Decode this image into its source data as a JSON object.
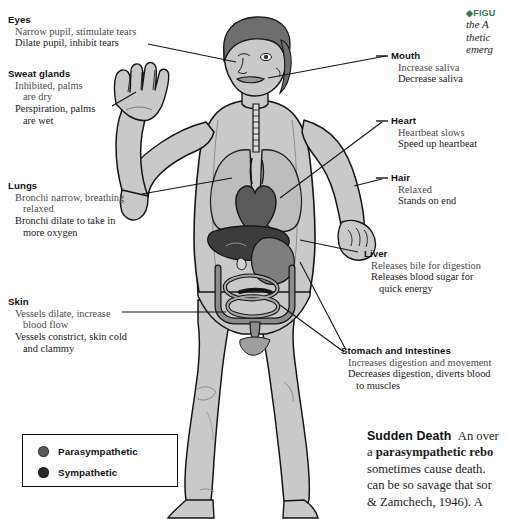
{
  "callouts": [
    {
      "id": "eyes",
      "title": "Eyes",
      "lines": [
        "Narrow pupil, stimulate tears",
        "Dilate pupil, inhibit tears"
      ]
    },
    {
      "id": "sweat-glands",
      "title": "Sweat glands",
      "lines": [
        "Inhibited, palms",
        "are dry",
        "Perspiration, palms",
        "are wet"
      ]
    },
    {
      "id": "lungs",
      "title": "Lungs",
      "lines": [
        "Bronchi narrow, breathing",
        "relaxed",
        "Bronchi dilate to take in",
        "more oxygen"
      ]
    },
    {
      "id": "skin",
      "title": "Skin",
      "lines": [
        "Vessels dilate, increase",
        "blood flow",
        "Vessels constrict, skin cold",
        "and clammy"
      ]
    },
    {
      "id": "mouth",
      "title": "Mouth",
      "lines": [
        "Increase saliva",
        "Decrease saliva"
      ]
    },
    {
      "id": "heart",
      "title": "Heart",
      "lines": [
        "Heartbeat slows",
        "Speed up heartbeat"
      ]
    },
    {
      "id": "hair",
      "title": "Hair",
      "lines": [
        "Relaxed",
        "Stands on end"
      ]
    },
    {
      "id": "liver",
      "title": "Liver",
      "lines": [
        "Releases bile for digestion",
        "Releases blood sugar for",
        "quick energy"
      ]
    },
    {
      "id": "stomach-and-intestines",
      "title": "Stomach and Intestines",
      "lines": [
        "Increases digestion and movement",
        "Decreases digestion, diverts blood",
        "to muscles"
      ]
    }
  ],
  "legend": {
    "items": [
      {
        "label": "Parasympathetic",
        "color": "#595959"
      },
      {
        "label": "Sympathetic",
        "color": "#2b2b2b"
      }
    ]
  },
  "figcaption": {
    "tag": "◆FIGU",
    "lines": [
      "the A",
      "thetic",
      "emerg"
    ]
  },
  "sudden_death": {
    "heading": "Sudden Death",
    "line1_rest": "An over",
    "line2_pre": "a ",
    "line2_bold": "parasympathetic rebo",
    "line3": "sometimes cause death.",
    "line4": "can be so savage that sor",
    "line5": "& Zamchech, 1946). A"
  },
  "colors": {
    "skin": "#c9c9c9",
    "skin_shade": "#b0b0b0",
    "organ_dark": "#4a4a4a",
    "organ_mid": "#8a8a8a",
    "organ_light": "#bdbdbd",
    "outline": "#151515",
    "accent_green": "#2f7d4f"
  }
}
